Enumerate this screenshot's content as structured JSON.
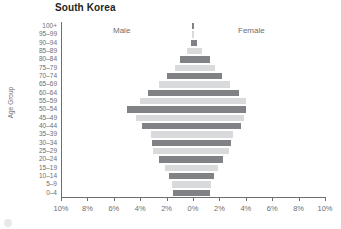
{
  "chart": {
    "title": "South Korea",
    "y_axis_label": "Age Group",
    "series_labels": {
      "male": "Male",
      "female": "Female"
    }
  },
  "chart_data": {
    "type": "bar",
    "subtype": "population-pyramid",
    "title": "South Korea",
    "xlabel": "",
    "ylabel": "Age Group",
    "xlim": [
      -10,
      10
    ],
    "xtick_labels": [
      "10%",
      "8%",
      "6%",
      "4%",
      "2%",
      "0%",
      "2%",
      "4%",
      "6%",
      "8%",
      "10%"
    ],
    "xtick_values": [
      -10,
      -8,
      -6,
      -4,
      -2,
      0,
      2,
      4,
      6,
      8,
      10
    ],
    "grid": false,
    "legend_position": "inside-top",
    "categories": [
      "100+",
      "95–99",
      "90–94",
      "85–89",
      "80–84",
      "75–79",
      "70–74",
      "65–69",
      "60–64",
      "55–59",
      "50–54",
      "45–49",
      "40–44",
      "35–39",
      "30–34",
      "25–29",
      "20–24",
      "15–19",
      "10–14",
      "5–9",
      "0–4"
    ],
    "series": [
      {
        "name": "Male",
        "color": "#808285",
        "values": [
          0.01,
          0.05,
          0.15,
          0.45,
          0.95,
          1.35,
          1.95,
          2.6,
          3.4,
          4.0,
          5.0,
          4.3,
          3.9,
          3.2,
          3.1,
          3.0,
          2.6,
          2.1,
          1.8,
          1.6,
          1.5
        ]
      },
      {
        "name": "Female",
        "color": "#d9dadb",
        "values": [
          0.02,
          0.1,
          0.3,
          0.7,
          1.3,
          1.7,
          2.2,
          2.8,
          3.5,
          4.0,
          4.0,
          3.9,
          3.6,
          3.0,
          2.9,
          2.7,
          2.3,
          1.9,
          1.6,
          1.4,
          1.3
        ]
      }
    ]
  }
}
